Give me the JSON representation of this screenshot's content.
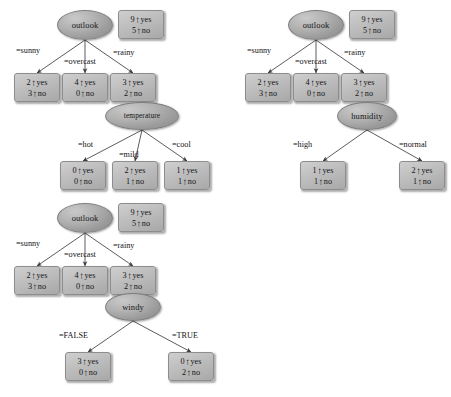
{
  "diagram": {
    "arrow_glyph": "↑",
    "colors": {
      "node_fill": "#b2b2b2",
      "leaf_fill": "#bdbdbd",
      "edge_stroke": "#4a4a4a",
      "text": "#141414",
      "background": "#ffffff"
    },
    "trees": [
      {
        "id": "tree-temperature",
        "root": {
          "label": "outlook",
          "x": 57,
          "y": 10,
          "w": 56,
          "h": 30
        },
        "root_stats": {
          "yes_count": "9",
          "yes_label": "yes",
          "no_count": "5",
          "no_label": "no",
          "x": 118,
          "y": 10,
          "w": 46,
          "h": 29
        },
        "branches": [
          {
            "label": "=sunny",
            "lx": 16,
            "ly": 46
          },
          {
            "label": "=overcast",
            "lx": 64,
            "ly": 57
          },
          {
            "label": "=rainy",
            "lx": 113,
            "ly": 48
          }
        ],
        "leaves": [
          {
            "yes_count": "2",
            "no_count": "3",
            "yes_label": "yes",
            "no_label": "no",
            "x": 14,
            "y": 73,
            "w": 46,
            "h": 29
          },
          {
            "yes_count": "4",
            "no_count": "0",
            "yes_label": "yes",
            "no_label": "no",
            "x": 62,
            "y": 73,
            "w": 46,
            "h": 29
          },
          {
            "yes_count": "3",
            "no_count": "2",
            "yes_label": "yes",
            "no_label": "no",
            "x": 110,
            "y": 73,
            "w": 46,
            "h": 29
          }
        ],
        "sub": {
          "node": {
            "label": "temperature",
            "x": 105,
            "y": 102,
            "w": 74,
            "h": 28
          },
          "branches": [
            {
              "label": "=hot",
              "lx": 78,
              "ly": 140
            },
            {
              "label": "=mild",
              "lx": 119,
              "ly": 150
            },
            {
              "label": "=cool",
              "lx": 172,
              "ly": 140
            }
          ],
          "leaves": [
            {
              "yes_count": "0",
              "no_count": "0",
              "yes_label": "yes",
              "no_label": "no",
              "x": 60,
              "y": 161,
              "w": 46,
              "h": 29
            },
            {
              "yes_count": "2",
              "no_count": "1",
              "yes_label": "yes",
              "no_label": "no",
              "x": 112,
              "y": 161,
              "w": 46,
              "h": 29
            },
            {
              "yes_count": "1",
              "no_count": "1",
              "yes_label": "yes",
              "no_label": "no",
              "x": 164,
              "y": 161,
              "w": 46,
              "h": 29
            }
          ]
        }
      },
      {
        "id": "tree-humidity",
        "root": {
          "label": "outlook",
          "x": 288,
          "y": 10,
          "w": 56,
          "h": 30
        },
        "root_stats": {
          "yes_count": "9",
          "yes_label": "yes",
          "no_count": "5",
          "no_label": "no",
          "x": 349,
          "y": 10,
          "w": 46,
          "h": 29
        },
        "branches": [
          {
            "label": "=sunny",
            "lx": 247,
            "ly": 46
          },
          {
            "label": "=overcast",
            "lx": 295,
            "ly": 57
          },
          {
            "label": "=rainy",
            "lx": 344,
            "ly": 48
          }
        ],
        "leaves": [
          {
            "yes_count": "2",
            "no_count": "3",
            "yes_label": "yes",
            "no_label": "no",
            "x": 245,
            "y": 73,
            "w": 46,
            "h": 29
          },
          {
            "yes_count": "4",
            "no_count": "0",
            "yes_label": "yes",
            "no_label": "no",
            "x": 293,
            "y": 73,
            "w": 46,
            "h": 29
          },
          {
            "yes_count": "3",
            "no_count": "2",
            "yes_label": "yes",
            "no_label": "no",
            "x": 341,
            "y": 73,
            "w": 46,
            "h": 29
          }
        ],
        "sub": {
          "node": {
            "label": "humidity",
            "x": 337,
            "y": 102,
            "w": 60,
            "h": 28
          },
          "branches": [
            {
              "label": "=high",
              "lx": 293,
              "ly": 140
            },
            {
              "label": "=normal",
              "lx": 399,
              "ly": 140
            }
          ],
          "leaves": [
            {
              "yes_count": "1",
              "no_count": "1",
              "yes_label": "yes",
              "no_label": "no",
              "x": 300,
              "y": 161,
              "w": 46,
              "h": 29
            },
            {
              "yes_count": "2",
              "no_count": "1",
              "yes_label": "yes",
              "no_label": "no",
              "x": 399,
              "y": 161,
              "w": 46,
              "h": 29
            }
          ]
        }
      },
      {
        "id": "tree-windy",
        "root": {
          "label": "outlook",
          "x": 57,
          "y": 203,
          "w": 56,
          "h": 30
        },
        "root_stats": {
          "yes_count": "9",
          "yes_label": "yes",
          "no_count": "5",
          "no_label": "no",
          "x": 118,
          "y": 203,
          "w": 46,
          "h": 29
        },
        "branches": [
          {
            "label": "=sunny",
            "lx": 16,
            "ly": 239
          },
          {
            "label": "=overcast",
            "lx": 64,
            "ly": 250
          },
          {
            "label": "=rainy",
            "lx": 113,
            "ly": 241
          }
        ],
        "leaves": [
          {
            "yes_count": "2",
            "no_count": "3",
            "yes_label": "yes",
            "no_label": "no",
            "x": 14,
            "y": 266,
            "w": 46,
            "h": 29
          },
          {
            "yes_count": "4",
            "no_count": "0",
            "yes_label": "yes",
            "no_label": "no",
            "x": 62,
            "y": 266,
            "w": 46,
            "h": 29
          },
          {
            "yes_count": "3",
            "no_count": "2",
            "yes_label": "yes",
            "no_label": "no",
            "x": 110,
            "y": 266,
            "w": 46,
            "h": 29
          }
        ],
        "sub": {
          "node": {
            "label": "windy",
            "x": 105,
            "y": 293,
            "w": 56,
            "h": 28
          },
          "branches": [
            {
              "label": "=FALSE",
              "lx": 59,
              "ly": 331
            },
            {
              "label": "=TRUE",
              "lx": 172,
              "ly": 331
            }
          ],
          "leaves": [
            {
              "yes_count": "3",
              "no_count": "0",
              "yes_label": "yes",
              "no_label": "no",
              "x": 65,
              "y": 352,
              "w": 46,
              "h": 29
            },
            {
              "yes_count": "0",
              "no_count": "2",
              "yes_label": "yes",
              "no_label": "no",
              "x": 168,
              "y": 352,
              "w": 46,
              "h": 29
            }
          ]
        }
      }
    ]
  }
}
